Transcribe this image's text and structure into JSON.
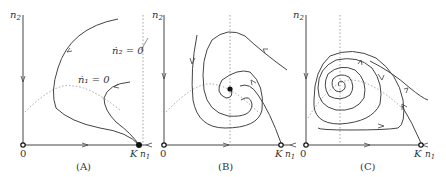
{
  "figure": {
    "panels": [
      {
        "id": "A",
        "caption": "(A)",
        "y_axis_label": "n",
        "y_axis_sub": "2",
        "x_axis_label": "n",
        "x_axis_sub": "1",
        "origin_label": "0",
        "carrying_capacity_label": "K",
        "nullcline_n1": "ṅ₁ = 0",
        "nullcline_n2": "ṅ₂ = 0",
        "description": "Trajectories converge to stable equilibrium at K"
      },
      {
        "id": "B",
        "caption": "(B)",
        "y_axis_label": "n",
        "y_axis_sub": "2",
        "x_axis_label": "n",
        "x_axis_sub": "1",
        "origin_label": "0",
        "carrying_capacity_label": "K",
        "description": "Trajectories spiral into stable interior equilibrium"
      },
      {
        "id": "C",
        "caption": "(C)",
        "y_axis_label": "n",
        "y_axis_sub": "2",
        "x_axis_label": "n",
        "x_axis_sub": "1",
        "origin_label": "0",
        "carrying_capacity_label": "K",
        "description": "Trajectories spiral outward from unstable equilibrium toward limit cycle"
      }
    ],
    "colors": {
      "curve": "#444444",
      "nullcline": "#9a9a9a",
      "point": "#111111"
    }
  }
}
